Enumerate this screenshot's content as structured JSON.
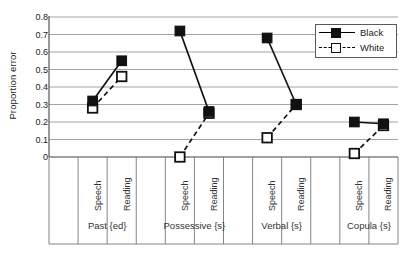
{
  "chart_data": {
    "type": "line",
    "title": "",
    "xlabel": "",
    "ylabel": "Proportion error",
    "ylim": [
      0,
      0.8
    ],
    "ytick_labels": [
      "0",
      "0.1",
      "0.2",
      "0.3",
      "0.4",
      "0.5",
      "0.6",
      "0.7",
      "0.8"
    ],
    "ytick_values": [
      0,
      0.1,
      0.2,
      0.3,
      0.4,
      0.5,
      0.6,
      0.7,
      0.8
    ],
    "grid": true,
    "legend_position": "top-right",
    "groups": [
      {
        "name": "Past {ed}",
        "categories": [
          "Speech",
          "Reading"
        ]
      },
      {
        "name": "Possessive {s}",
        "categories": [
          "Speech",
          "Reading"
        ]
      },
      {
        "name": "Verbal {s}",
        "categories": [
          "Speech",
          "Reading"
        ]
      },
      {
        "name": "Copula {s}",
        "categories": [
          "Speech",
          "Reading"
        ]
      }
    ],
    "categories": [
      "Speech",
      "Reading",
      "Speech",
      "Reading",
      "Speech",
      "Reading",
      "Speech",
      "Reading"
    ],
    "series": [
      {
        "name": "Black",
        "marker": "filled-square",
        "line": "solid",
        "color": "#111111",
        "values": [
          0.32,
          0.55,
          0.72,
          0.26,
          0.68,
          0.3,
          0.2,
          0.19
        ]
      },
      {
        "name": "White",
        "marker": "open-square",
        "line": "dashed",
        "color": "#111111",
        "values": [
          0.28,
          0.46,
          0.0,
          0.25,
          0.11,
          0.3,
          0.02,
          0.18
        ]
      }
    ]
  },
  "legend": {
    "entries": [
      {
        "label": "Black",
        "style": "solid",
        "marker": "filled-square"
      },
      {
        "label": "White",
        "style": "dashed",
        "marker": "open-square"
      }
    ]
  },
  "axis": {
    "y_title": "Proportion error"
  }
}
